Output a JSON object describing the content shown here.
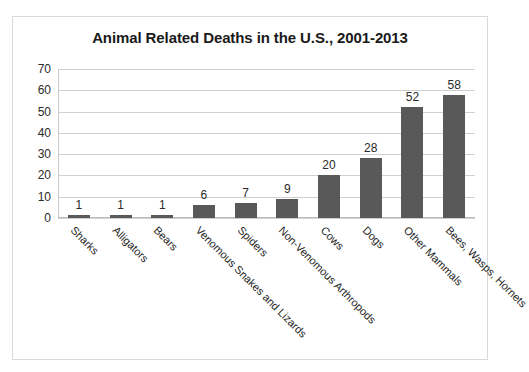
{
  "chart_data": {
    "type": "bar",
    "title": "Animal Related Deaths in the U.S., 2001-2013",
    "xlabel": "",
    "ylabel": "",
    "ylim": [
      0,
      70
    ],
    "yticks": [
      0,
      10,
      20,
      30,
      40,
      50,
      60,
      70
    ],
    "grid": true,
    "legend": false,
    "data_labels": true,
    "categories": [
      "Sharks",
      "Alligators",
      "Bears",
      "Venomous Snakes and Lizards",
      "Spiders",
      "Non-Venomous Arthropods",
      "Cows",
      "Dogs",
      "Other Mammals",
      "Bees, Wasps, Hornets"
    ],
    "values": [
      1,
      1,
      1,
      6,
      7,
      9,
      20,
      28,
      52,
      58
    ],
    "colors": {
      "bar": "#595959",
      "gridline": "#d0d0d0",
      "axis": "#bdbdbd",
      "text": "#262626",
      "frame": "#d9d9d9",
      "background": "#ffffff"
    }
  }
}
